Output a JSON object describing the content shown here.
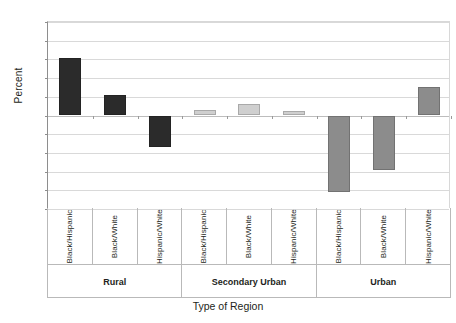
{
  "chart_data": {
    "type": "bar",
    "title": "",
    "xlabel": "Type of Region",
    "ylabel": "Percent",
    "ylim": [
      -25,
      25
    ],
    "yticks": [
      25,
      20,
      15,
      10,
      5,
      0,
      -5,
      -10,
      -15,
      -20,
      -25
    ],
    "grid": true,
    "legend": "none",
    "categories": [
      "Black/Hispanic",
      "Black/White",
      "Hispanic/White"
    ],
    "groups": [
      {
        "name": "Rural",
        "color": "#2b2b2b",
        "bars": [
          {
            "category": "Black/Hispanic",
            "value": 15.3
          },
          {
            "category": "Black/White",
            "value": 5.5
          },
          {
            "category": "Hispanic/White",
            "value": -8.3
          }
        ]
      },
      {
        "name": "Secondary Urban",
        "color": "#cfcfcf",
        "bars": [
          {
            "category": "Black/Hispanic",
            "value": 1.5
          },
          {
            "category": "Black/White",
            "value": 3.2
          },
          {
            "category": "Hispanic/White",
            "value": 1.3
          }
        ]
      },
      {
        "name": "Urban",
        "color": "#8c8c8c",
        "bars": [
          {
            "category": "Black/Hispanic",
            "value": -20.5
          },
          {
            "category": "Black/White",
            "value": -14.5
          },
          {
            "category": "Hispanic/White",
            "value": 7.5
          }
        ]
      }
    ]
  },
  "axis": {
    "y_title": "Percent",
    "x_title": "Type of Region",
    "tick_labels": [
      "25",
      "20",
      "15",
      "10",
      "5",
      "0",
      "-5",
      "-10",
      "-15",
      "-20",
      "-25"
    ]
  }
}
